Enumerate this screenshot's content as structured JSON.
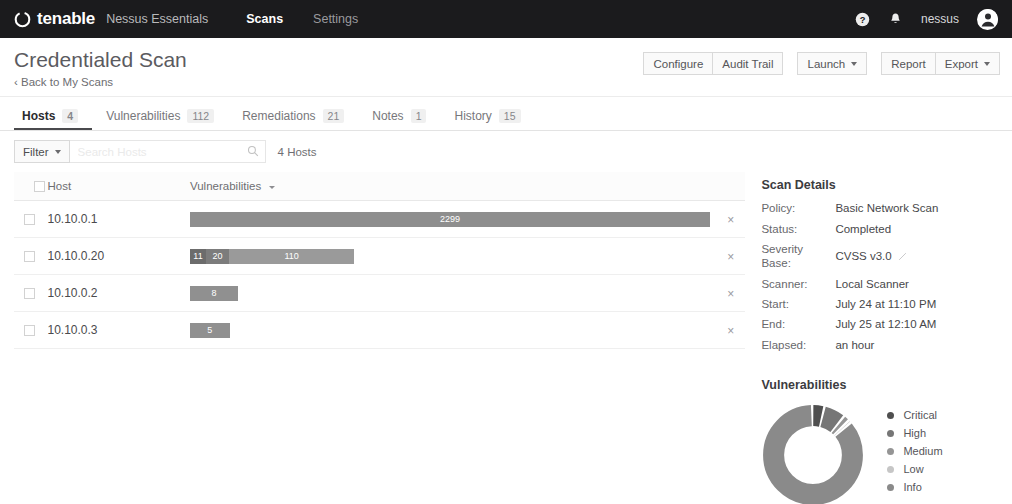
{
  "topnav": {
    "brand": "tenable",
    "product": "Nessus Essentials",
    "links": [
      {
        "label": "Scans",
        "active": true
      },
      {
        "label": "Settings",
        "active": false
      }
    ],
    "help_icon": "help-circle-icon",
    "bell_icon": "bell-icon",
    "username": "nessus",
    "avatar_icon": "user-avatar-icon"
  },
  "pagehead": {
    "title": "Credentialed Scan",
    "back_link": "‹ Back to My Scans",
    "actions": [
      {
        "label": "Configure",
        "caret": false
      },
      {
        "label": "Audit Trail",
        "caret": false
      },
      {
        "label": "Launch",
        "caret": true
      },
      {
        "label": "Report",
        "caret": false
      },
      {
        "label": "Export",
        "caret": true
      }
    ]
  },
  "tabs": [
    {
      "label": "Hosts",
      "count": "4",
      "active": true
    },
    {
      "label": "Vulnerabilities",
      "count": "112",
      "active": false
    },
    {
      "label": "Remediations",
      "count": "21",
      "active": false
    },
    {
      "label": "Notes",
      "count": "1",
      "active": false
    },
    {
      "label": "History",
      "count": "15",
      "active": false
    }
  ],
  "filterbar": {
    "filter_label": "Filter",
    "search_placeholder": "Search Hosts",
    "search_value": "",
    "search_icon": "search-icon",
    "result_count": "4 Hosts"
  },
  "table": {
    "columns": [
      "Host",
      "Vulnerabilities"
    ],
    "sorted_column": "Vulnerabilities",
    "rows": [
      {
        "host": "10.10.0.1",
        "total": 2299,
        "segments": [
          {
            "severity": "Info",
            "value": 2299,
            "label": "2299",
            "color": "#8e8e8e"
          }
        ]
      },
      {
        "host": "10.10.0.20",
        "total": 141,
        "segments": [
          {
            "severity": "Critical",
            "value": 11,
            "label": "11",
            "color": "#6c6c6c"
          },
          {
            "severity": "High",
            "value": 20,
            "label": "20",
            "color": "#7c7c7c"
          },
          {
            "severity": "Info",
            "value": 110,
            "label": "110",
            "color": "#9a9a9a"
          }
        ]
      },
      {
        "host": "10.10.0.2",
        "total": 8,
        "segments": [
          {
            "severity": "Info",
            "value": 8,
            "label": "8",
            "color": "#909090"
          }
        ]
      },
      {
        "host": "10.10.0.3",
        "total": 5,
        "segments": [
          {
            "severity": "Info",
            "value": 5,
            "label": "5",
            "color": "#909090"
          }
        ]
      }
    ],
    "remove_label": "×"
  },
  "scan_details": {
    "heading": "Scan Details",
    "fields": [
      {
        "key": "Policy:",
        "value": "Basic Network Scan",
        "editable": false
      },
      {
        "key": "Status:",
        "value": "Completed",
        "editable": false
      },
      {
        "key": "Severity Base:",
        "value": "CVSS v3.0",
        "editable": true
      },
      {
        "key": "Scanner:",
        "value": "Local Scanner",
        "editable": false
      },
      {
        "key": "Start:",
        "value": "July 24 at 11:10 PM",
        "editable": false
      },
      {
        "key": "End:",
        "value": "July 25 at 12:10 AM",
        "editable": false
      },
      {
        "key": "Elapsed:",
        "value": "an hour",
        "editable": false
      }
    ]
  },
  "chart_data": {
    "type": "pie",
    "title": "Vulnerabilities",
    "labels": [
      "Critical",
      "High",
      "Medium",
      "Low",
      "Info"
    ],
    "values": [
      4,
      7,
      2,
      1,
      86
    ],
    "colors": [
      "#4f4f4f",
      "#767676",
      "#959595",
      "#c6c6c6",
      "#8a8a8a"
    ],
    "donut": true,
    "legend_position": "right"
  }
}
